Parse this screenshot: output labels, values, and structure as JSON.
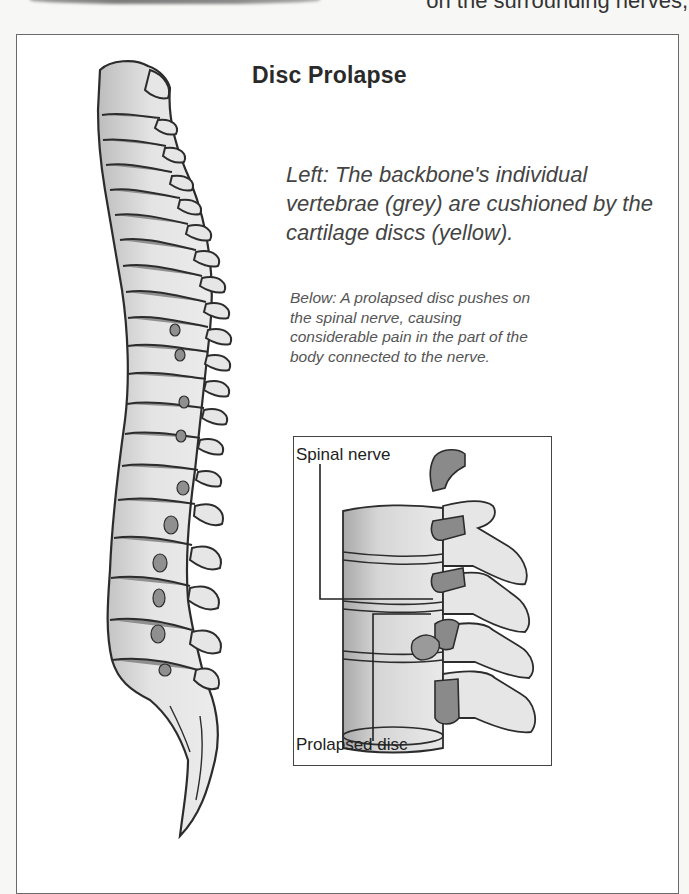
{
  "page": {
    "top_text_fragment": "on the surrounding nerves,"
  },
  "figure": {
    "title": "Disc Prolapse",
    "caption_left": "Left: The backbone's individual vertebrae (grey) are cushioned by the cartilage discs (yellow).",
    "caption_below": "Below: A prolapsed disc pushes on the spinal nerve, causing considerable pain in the part of the body connected to the nerve.",
    "inset": {
      "labels": {
        "spinal_nerve": "Spinal nerve",
        "prolapsed_disc": "Prolapsed disc"
      }
    },
    "colors": {
      "bone_fill": "#e2e2e2",
      "bone_shade": "#c4c4c4",
      "disc_fill": "#8f8f8f",
      "outline": "#2c2c2c",
      "frame": "#6a6a6a"
    }
  }
}
